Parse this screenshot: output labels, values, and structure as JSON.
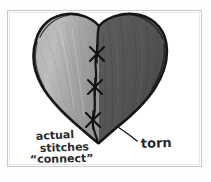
{
  "figure": {
    "kind": "hand-drawn-sketch",
    "frame": {
      "x": 7,
      "y": 10,
      "width": 195,
      "height": 157,
      "border_color": "#c9c9c9"
    },
    "background_color": "#fdfdfc",
    "ink_color": "#1d1d1d"
  },
  "heart": {
    "left_half": {
      "label": "left half",
      "fill_color": "#a9a9a9"
    },
    "right_half": {
      "label": "right half",
      "fill_color": "#555555"
    },
    "outline_color": "#171717",
    "seam": {
      "label": "tear seam",
      "color": "#141414"
    }
  },
  "stitches": [
    {
      "label": "stitch-1",
      "x": 97,
      "y": 54,
      "size": 9
    },
    {
      "label": "stitch-2",
      "x": 95,
      "y": 87,
      "size": 9
    },
    {
      "label": "stitch-3",
      "x": 93,
      "y": 120,
      "size": 9
    }
  ],
  "annotations": {
    "left": {
      "name": "stitches-annotation",
      "line1": "actual",
      "line2": "stitches",
      "line3": "“connect”",
      "x": 30,
      "y": 140
    },
    "right": {
      "name": "torn-annotation",
      "text": "torn",
      "x": 136,
      "y": 147,
      "leader": {
        "from_x": 137,
        "from_y": 140,
        "to_x": 118,
        "to_y": 127
      }
    }
  }
}
